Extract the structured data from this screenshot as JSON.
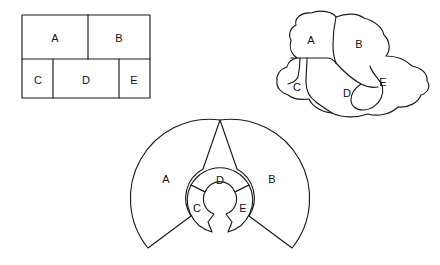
{
  "figure": {
    "background_color": "#ffffff",
    "stroke_color": "#1a1a1a",
    "label_color": "#111111",
    "panels": [
      {
        "id": "rectangular-partition",
        "name": "Rectangular partition diagram",
        "labels": [
          {
            "text": "A",
            "x": 55,
            "y": 39
          },
          {
            "text": "B",
            "x": 119,
            "y": 39
          },
          {
            "text": "C",
            "x": 38,
            "y": 81
          },
          {
            "text": "D",
            "x": 86,
            "y": 81
          },
          {
            "text": "E",
            "x": 134,
            "y": 81
          }
        ]
      },
      {
        "id": "organic-blob-partition",
        "name": "Irregular blob partition diagram",
        "labels": [
          {
            "text": "A",
            "x": 311,
            "y": 41
          },
          {
            "text": "B",
            "x": 359,
            "y": 45
          },
          {
            "text": "C",
            "x": 297,
            "y": 88
          },
          {
            "text": "D",
            "x": 347,
            "y": 94
          },
          {
            "text": "E",
            "x": 383,
            "y": 83
          }
        ]
      },
      {
        "id": "radial-fan-partition",
        "name": "Radial fan / annulus partition diagram",
        "labels": [
          {
            "text": "A",
            "x": 166,
            "y": 180
          },
          {
            "text": "B",
            "x": 272,
            "y": 180
          },
          {
            "text": "D",
            "x": 220,
            "y": 181
          },
          {
            "text": "C",
            "x": 197,
            "y": 209
          },
          {
            "text": "E",
            "x": 243,
            "y": 209
          }
        ]
      }
    ],
    "region_names": [
      "A",
      "B",
      "C",
      "D",
      "E"
    ]
  }
}
